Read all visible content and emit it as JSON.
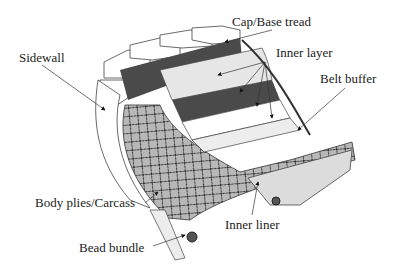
{
  "diagram": {
    "labels": {
      "sidewall": "Sidewall",
      "cap_base_tread": "Cap/Base tread",
      "inner_layer": "Inner layer",
      "belt_buffer": "Belt buffer",
      "body_plies": "Body plies/Carcass",
      "inner_liner": "Inner liner",
      "bead_bundle": "Bead bundle"
    },
    "colors": {
      "dark_band": "#4a4a4a",
      "light_layer": "#e6e6e6",
      "carcass": "#b8b8b8",
      "liner": "#dcdcdc",
      "outline": "#333333"
    }
  }
}
